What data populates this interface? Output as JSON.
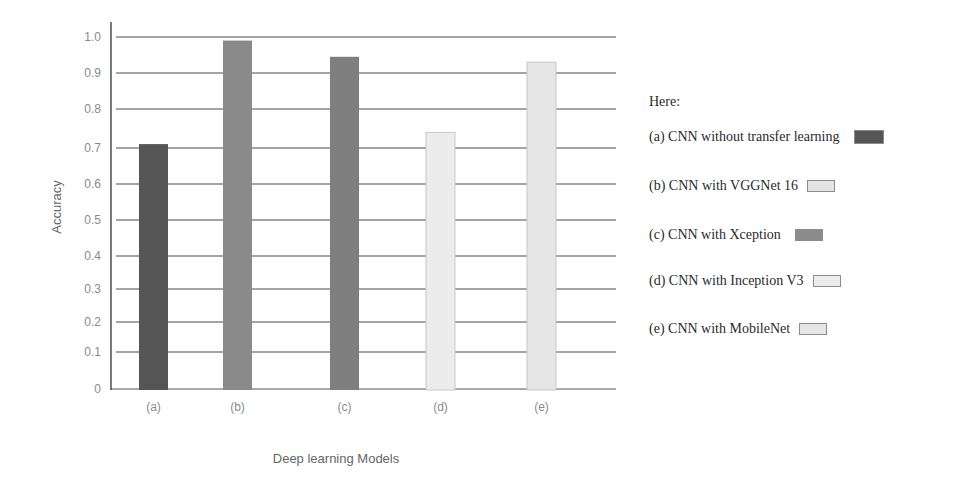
{
  "chart_data": {
    "type": "bar",
    "title": "",
    "xlabel": "Deep learning Models",
    "ylabel": "Accuracy",
    "ylim": [
      0,
      1.0
    ],
    "yticks": [
      "0",
      "0.1",
      "0.2",
      "0.3",
      "0.4",
      "0.5",
      "0.6",
      "0.7",
      "0.8",
      "0.9",
      "1.0"
    ],
    "grid": true,
    "categories": [
      "(a)",
      "(b)",
      "(c)",
      "(d)",
      "(e)"
    ],
    "values": [
      0.71,
      0.99,
      0.945,
      0.74,
      0.93
    ],
    "colors": [
      "#555555",
      "#8a8a8a",
      "#7f7f7f",
      "#ececec",
      "#e6e6e6"
    ],
    "legend_position": "right",
    "legend": {
      "title": "Here:",
      "entries": [
        {
          "label": "(a) CNN without transfer learning",
          "color": "#555555"
        },
        {
          "label": "(b) CNN with VGGNet 16",
          "color": "#e3e3e3"
        },
        {
          "label": "(c) CNN with Xception",
          "color": "#8c8c8c"
        },
        {
          "label": "(d) CNN with Inception V3",
          "color": "#ececec"
        },
        {
          "label": "(e) CNN with MobileNet",
          "color": "#e6e6e6"
        }
      ]
    }
  }
}
